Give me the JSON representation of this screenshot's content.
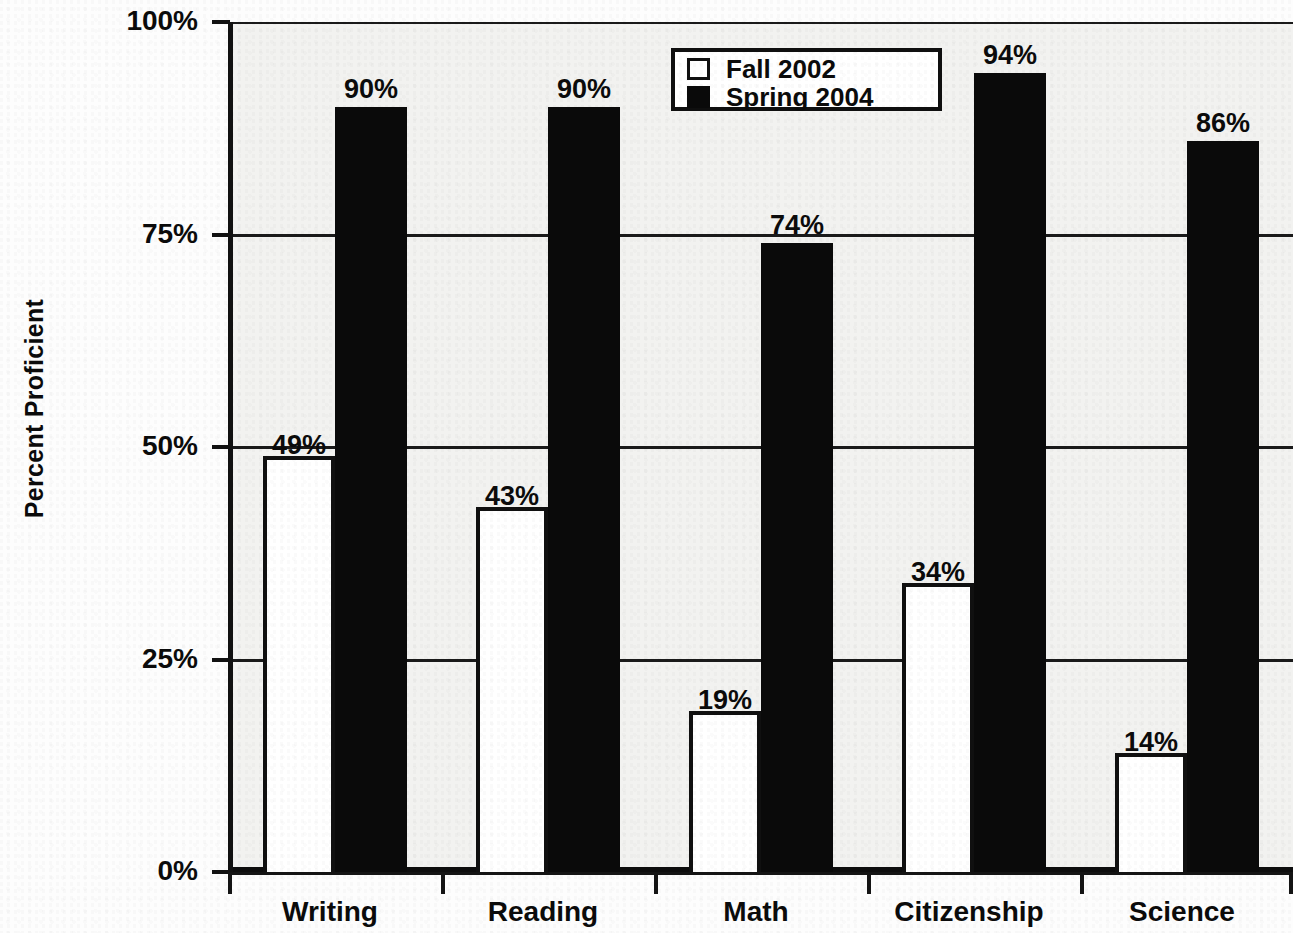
{
  "chart_data": {
    "type": "bar",
    "title": "",
    "xlabel": "",
    "ylabel": "Percent Proficient",
    "ylim": [
      0,
      100
    ],
    "ytick_labels": [
      "100%",
      "75%",
      "50%",
      "25%",
      "0%"
    ],
    "ytick_values": [
      100,
      75,
      50,
      25,
      0
    ],
    "grid": true,
    "legend_position": "top-center",
    "categories": [
      "Writing",
      "Reading",
      "Math",
      "Citizenship",
      "Science"
    ],
    "series": [
      {
        "name": "Fall 2002",
        "style": "hollow",
        "color": "#ffffff",
        "values": [
          49,
          43,
          19,
          34,
          14
        ],
        "labels": [
          "49%",
          "43%",
          "19%",
          "34%",
          "14%"
        ]
      },
      {
        "name": "Spring 2004",
        "style": "solid",
        "color": "#0a0a0a",
        "values": [
          90,
          90,
          74,
          94,
          86
        ],
        "labels": [
          "90%",
          "90%",
          "74%",
          "94%",
          "86%"
        ]
      }
    ]
  },
  "axis": {
    "y_title": "Percent Proficient"
  },
  "legend": {
    "entries": [
      {
        "label": "Fall 2002",
        "swatch": "hollow-square-icon"
      },
      {
        "label": "Spring 2004",
        "swatch": "filled-square-icon"
      }
    ]
  }
}
